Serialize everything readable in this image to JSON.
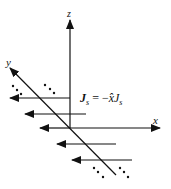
{
  "diagram": {
    "axes": {
      "z_label": "z",
      "x_label": "x",
      "y_label": "y"
    },
    "equation": {
      "lhs_symbol": "J",
      "lhs_sub": "s",
      "equals": "=",
      "rhs_sign": "−",
      "rhs_unit": "x̂",
      "rhs_symbol": "J",
      "rhs_sub": "s"
    },
    "current_arrows": [
      {
        "y": 98,
        "x_start": 70,
        "x_end": 10
      },
      {
        "y": 114,
        "x_start": 86,
        "x_end": 25
      },
      {
        "y": 128,
        "x_start": 70,
        "x_end": 40
      },
      {
        "y": 144,
        "x_start": 116,
        "x_end": 57
      },
      {
        "y": 160,
        "x_start": 132,
        "x_end": 72
      }
    ],
    "continuation_dots": "…",
    "colors": {
      "stroke": "#111111",
      "background": "#ffffff"
    }
  }
}
